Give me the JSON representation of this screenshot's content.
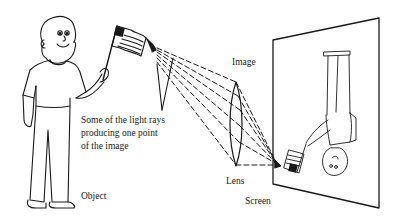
{
  "figure": {
    "labels": {
      "object": "Object",
      "image": "Image",
      "lens": "Lens",
      "screen": "Screen"
    },
    "caption_lines": [
      "Some of the light rays",
      "producing one point",
      "of the image"
    ],
    "colors": {
      "ink": "#1a1a1a",
      "background": "#ffffff"
    },
    "elements": [
      "boy-holding-flag (object)",
      "convex-lens",
      "dashed-light-rays",
      "screen",
      "inverted-image-of-boy"
    ]
  }
}
